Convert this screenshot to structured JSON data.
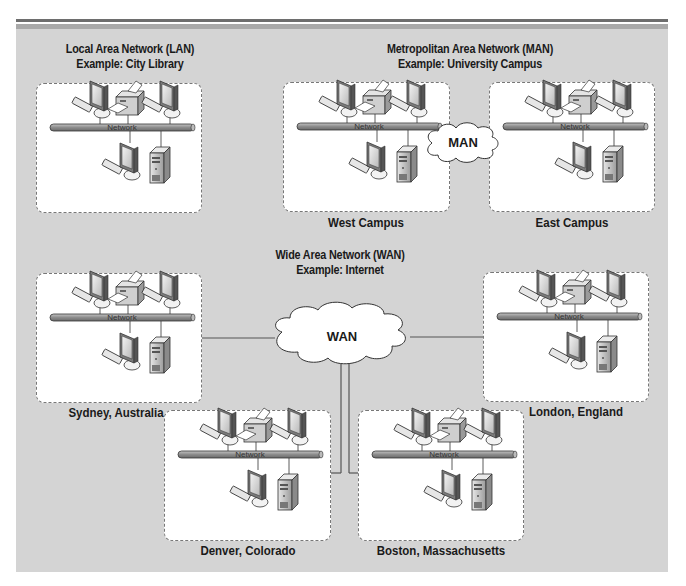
{
  "diagram": {
    "lan": {
      "title_line1": "Local Area Network (LAN)",
      "title_line2": "Example: City Library"
    },
    "man": {
      "title_line1": "Metropolitan Area Network (MAN)",
      "title_line2": "Example: University Campus",
      "cloud_label": "MAN"
    },
    "wan": {
      "title_line1": "Wide Area Network (WAN)",
      "title_line2": "Example: Internet",
      "cloud_label": "WAN"
    },
    "network_label": "Network",
    "sites": [
      {
        "id": "lan-library",
        "label": ""
      },
      {
        "id": "west-campus",
        "label": "West Campus"
      },
      {
        "id": "east-campus",
        "label": "East Campus"
      },
      {
        "id": "sydney",
        "label": "Sydney,  Australia"
      },
      {
        "id": "london",
        "label": "London,  England"
      },
      {
        "id": "denver",
        "label": "Denver,  Colorado"
      },
      {
        "id": "boston",
        "label": "Boston,  Massachusetts"
      }
    ],
    "node_types": [
      "workstation-icon",
      "printer-icon",
      "server-icon",
      "network-bus"
    ],
    "colors": {
      "panel": "#d4d4d4",
      "box": "#ffffff",
      "bus": "#8e8e8e",
      "line": "#555555"
    }
  }
}
